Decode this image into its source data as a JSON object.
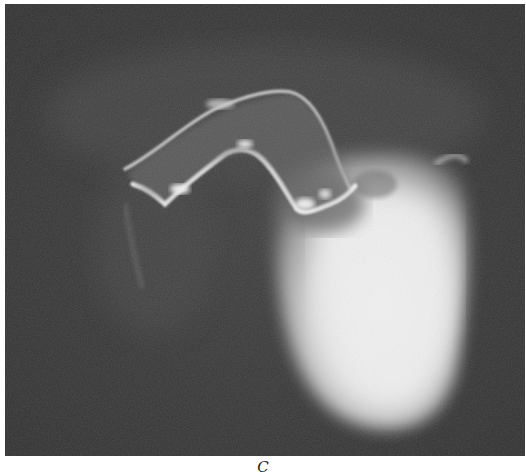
{
  "figure": {
    "panel_label": "C",
    "image_description": "Grayscale radiographic angiogram showing a bright contrast-filled cardiac chamber (lower right) with an arching vessel outline above, on a dark background",
    "colors": {
      "background": "#3a3a3a",
      "dark_noise": "#2e2e2e",
      "chamber_bright": "#f4f4f4",
      "vessel_highlight": "#e6e6e6",
      "caption_text": "#222222"
    }
  }
}
